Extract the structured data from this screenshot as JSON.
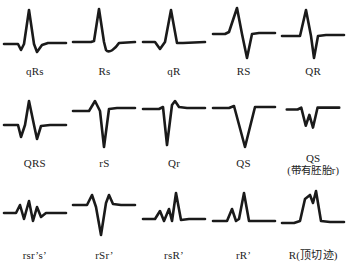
{
  "figure": {
    "stroke_color": "#1a1a1a",
    "background_color": "#ffffff",
    "rows": 3,
    "columns": 5
  },
  "chart_data": {
    "type": "line",
    "title": "",
    "xlabel": "",
    "ylabel": "",
    "grid": false,
    "legend_position": "none",
    "panels": [
      {
        "row": 1,
        "col": 1,
        "label": "qRs",
        "sub_label": "",
        "waveform": "small negative q, tall positive R, small negative s",
        "path": "M2,40 L16,40 L19,46 L22,40 L27,6 L32,40 L35,48 L40,41 L46,39 L64,39",
        "points": [
          [
            2,
            0
          ],
          [
            16,
            0
          ],
          [
            19,
            -6
          ],
          [
            22,
            0
          ],
          [
            27,
            34
          ],
          [
            32,
            0
          ],
          [
            35,
            -8
          ],
          [
            40,
            -1
          ],
          [
            46,
            1
          ],
          [
            64,
            1
          ]
        ]
      },
      {
        "row": 1,
        "col": 2,
        "label": "Rs",
        "sub_label": "",
        "waveform": "tall positive R followed by a small rounded negative s",
        "path": "M2,38 L20,38 L23,37 L28,5 L33,38 L35,46 C38,50 44,45 48,39 L64,38",
        "points": [
          [
            2,
            0
          ],
          [
            20,
            0
          ],
          [
            28,
            33
          ],
          [
            35,
            -8
          ],
          [
            48,
            -1
          ],
          [
            64,
            0
          ]
        ]
      },
      {
        "row": 1,
        "col": 3,
        "label": "qR",
        "sub_label": "",
        "waveform": "small negative q then tall positive R returning to baseline",
        "path": "M2,38 L14,38 L19,45 L24,38 L30,6 L36,39 L42,39 L64,38",
        "points": [
          [
            2,
            0
          ],
          [
            14,
            0
          ],
          [
            19,
            -7
          ],
          [
            24,
            0
          ],
          [
            30,
            32
          ],
          [
            36,
            -1
          ],
          [
            64,
            0
          ]
        ]
      },
      {
        "row": 1,
        "col": 4,
        "label": "RS",
        "sub_label": "",
        "waveform": "tall positive R and deep negative S of similar amplitude",
        "path": "M2,30 L14,30 L18,28 L26,4 L31,30 L36,54 L41,30 L48,29 L64,29",
        "points": [
          [
            2,
            0
          ],
          [
            14,
            0
          ],
          [
            26,
            26
          ],
          [
            36,
            -24
          ],
          [
            41,
            0
          ],
          [
            64,
            0
          ]
        ]
      },
      {
        "row": 1,
        "col": 5,
        "label": "QR",
        "sub_label": "",
        "waveform": "positive R deflection with deep negative Q, biphasic sharp spike",
        "path": "M2,32 L20,32 L26,6 L31,32 L34,54 L38,32 L46,31 L64,31",
        "points": [
          [
            2,
            0
          ],
          [
            20,
            0
          ],
          [
            26,
            26
          ],
          [
            34,
            -22
          ],
          [
            38,
            0
          ],
          [
            64,
            0
          ]
        ]
      },
      {
        "row": 2,
        "col": 1,
        "label": "QRS",
        "sub_label": "",
        "waveform": "negative Q, tall positive R, negative S",
        "path": "M2,30 L16,30 L19,42 L23,30 L27,6 L32,30 L35,44 L39,31 L48,30 L64,30",
        "points": [
          [
            2,
            0
          ],
          [
            16,
            0
          ],
          [
            19,
            -12
          ],
          [
            23,
            0
          ],
          [
            27,
            24
          ],
          [
            32,
            0
          ],
          [
            35,
            -14
          ],
          [
            39,
            0
          ],
          [
            64,
            0
          ]
        ]
      },
      {
        "row": 2,
        "col": 2,
        "label": "rS",
        "sub_label": "",
        "waveform": "small positive r then very deep negative S",
        "path": "M2,16 L18,16 L24,6 L29,16 L33,52 L38,14 L46,13 L64,13",
        "points": [
          [
            2,
            0
          ],
          [
            18,
            0
          ],
          [
            24,
            10
          ],
          [
            29,
            0
          ],
          [
            33,
            -36
          ],
          [
            38,
            2
          ],
          [
            64,
            3
          ]
        ]
      },
      {
        "row": 2,
        "col": 3,
        "label": "Qr",
        "sub_label": "",
        "waveform": "deep negative Q then small positive r",
        "path": "M2,14 L18,14 L22,12 L26,50 L31,10 L34,6 L38,12 L46,13 L64,13",
        "points": [
          [
            2,
            0
          ],
          [
            18,
            0
          ],
          [
            26,
            -36
          ],
          [
            34,
            8
          ],
          [
            38,
            2
          ],
          [
            64,
            1
          ]
        ]
      },
      {
        "row": 2,
        "col": 4,
        "label": "QS",
        "sub_label": "",
        "waveform": "entirely negative deep V-shaped QS complex",
        "path": "M2,13 L18,13 L23,11 L34,52 L44,12 L52,12 L64,12",
        "points": [
          [
            2,
            0
          ],
          [
            18,
            0
          ],
          [
            23,
            2
          ],
          [
            34,
            -39
          ],
          [
            44,
            1
          ],
          [
            64,
            1
          ]
        ]
      },
      {
        "row": 2,
        "col": 5,
        "label": "QS",
        "sub_label": "(带有胚胎r)",
        "waveform": "negative QS complex containing a tiny embryonic r notch, W shaped",
        "path": "M4,16 L16,16 L20,14 L25,34 L29,22 L33,36 L38,14 L46,14 L62,14",
        "points": [
          [
            4,
            0
          ],
          [
            16,
            0
          ],
          [
            25,
            -18
          ],
          [
            29,
            -6
          ],
          [
            33,
            -20
          ],
          [
            38,
            2
          ],
          [
            62,
            2
          ]
        ]
      },
      {
        "row": 3,
        "col": 1,
        "label": "rsr’s’",
        "sub_label": "",
        "waveform": "low amplitude multiphasic zigzag: r, s, r prime, s prime",
        "path": "M2,26 L14,26 L18,18 L22,32 L27,14 L31,34 L35,20 L39,30 L44,26 L64,26",
        "points": [
          [
            2,
            0
          ],
          [
            14,
            0
          ],
          [
            18,
            8
          ],
          [
            22,
            -6
          ],
          [
            27,
            12
          ],
          [
            31,
            -8
          ],
          [
            35,
            6
          ],
          [
            39,
            -4
          ],
          [
            64,
            0
          ]
        ]
      },
      {
        "row": 3,
        "col": 2,
        "label": "rSr’",
        "sub_label": "",
        "waveform": "small positive r, deep negative S, small positive r prime",
        "path": "M2,18 L16,18 L21,8 L25,20 L30,48 L35,16 L38,8 L42,17 L50,18 L64,18",
        "points": [
          [
            2,
            0
          ],
          [
            16,
            0
          ],
          [
            21,
            10
          ],
          [
            25,
            -2
          ],
          [
            30,
            -30
          ],
          [
            38,
            10
          ],
          [
            42,
            1
          ],
          [
            64,
            0
          ]
        ]
      },
      {
        "row": 3,
        "col": 3,
        "label": "rsR’",
        "sub_label": "",
        "waveform": "small r, small s, then tall positive R prime",
        "path": "M2,32 L14,32 L19,24 L23,34 L28,22 L31,34 L35,6 L40,33 L48,32 L64,32",
        "points": [
          [
            2,
            0
          ],
          [
            14,
            0
          ],
          [
            19,
            8
          ],
          [
            23,
            -2
          ],
          [
            28,
            10
          ],
          [
            31,
            -2
          ],
          [
            35,
            26
          ],
          [
            40,
            -1
          ],
          [
            64,
            0
          ]
        ]
      },
      {
        "row": 3,
        "col": 4,
        "label": "rR’",
        "sub_label": "",
        "waveform": "small positive r followed by tall positive R prime",
        "path": "M2,34 L16,34 L21,22 L25,34 L28,32 L33,6 L38,34 L46,34 L64,34",
        "points": [
          [
            2,
            0
          ],
          [
            16,
            0
          ],
          [
            21,
            12
          ],
          [
            25,
            0
          ],
          [
            33,
            28
          ],
          [
            38,
            0
          ],
          [
            64,
            0
          ]
        ]
      },
      {
        "row": 3,
        "col": 5,
        "label": "R(顶切迹)",
        "sub_label": "",
        "waveform": "broad positive R wave with a notch at its peak",
        "path": "M2,36 L14,36 L20,34 L25,12 L30,8 L33,16 L36,4 L41,34 L50,35 L64,35",
        "points": [
          [
            2,
            0
          ],
          [
            14,
            0
          ],
          [
            25,
            24
          ],
          [
            30,
            28
          ],
          [
            33,
            20
          ],
          [
            36,
            32
          ],
          [
            41,
            2
          ],
          [
            64,
            1
          ]
        ]
      }
    ]
  }
}
